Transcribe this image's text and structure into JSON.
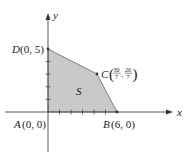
{
  "figure": {
    "region_label": "S",
    "axis_x_label": "x",
    "axis_y_label": "y",
    "points": {
      "A": {
        "name": "A",
        "coords": "(0, 0)",
        "x": 0,
        "y": 0
      },
      "B": {
        "name": "B",
        "coords": "(6, 0)",
        "x": 6,
        "y": 0
      },
      "C": {
        "name": "C",
        "x_num": "30",
        "x_den": "7",
        "y_num": "20",
        "y_den": "7",
        "x": 4.2857,
        "y": 2.8571
      },
      "D": {
        "name": "D",
        "coords": "(0, 5)",
        "x": 0,
        "y": 5
      }
    },
    "x_ticks": [
      1,
      2,
      3,
      4,
      5,
      6
    ],
    "y_ticks": [
      1,
      2,
      3,
      4,
      5
    ],
    "colors": {
      "region_fill": "#c9c9c9",
      "region_stroke": "#555555",
      "axis": "#444444",
      "text": "#222222"
    }
  }
}
